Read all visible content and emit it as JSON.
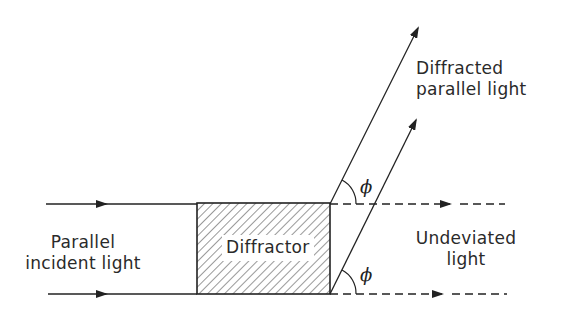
{
  "diagram": {
    "title": "",
    "labels": {
      "incident": [
        "Parallel",
        "incident light"
      ],
      "diffractor": "Diffractor",
      "diffracted": [
        "Diffracted",
        "parallel light"
      ],
      "undeviated": [
        "Undeviated",
        "light"
      ],
      "angle_upper": "ϕ",
      "angle_lower": "ϕ"
    },
    "elements": {
      "diffractor_box": {
        "x": 197,
        "y": 203,
        "width": 133,
        "height": 91,
        "fill": "hatched"
      },
      "incident_rays": [
        {
          "from": [
            46,
            204
          ],
          "to": [
            197,
            204
          ],
          "arrow_at": 100
        },
        {
          "from": [
            48,
            294
          ],
          "to": [
            197,
            294
          ],
          "arrow_at": 100
        }
      ],
      "undeviated_rays": [
        {
          "from": [
            330,
            204
          ],
          "to": [
            505,
            204
          ],
          "style": "dashed",
          "arrow_at": 448
        },
        {
          "from": [
            330,
            294
          ],
          "to": [
            507,
            294
          ],
          "style": "dashed",
          "arrow_at": 440
        }
      ],
      "diffracted_rays": [
        {
          "from": [
            330,
            204
          ],
          "to": [
            418,
            28
          ]
        },
        {
          "from": [
            330,
            294
          ],
          "to": [
            416,
            120
          ]
        }
      ]
    },
    "colors": {
      "line": "#222222",
      "background": "#ffffff"
    }
  }
}
